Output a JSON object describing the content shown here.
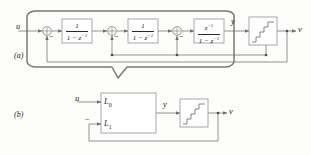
{
  "figure": {
    "part_a_label": "(a)",
    "part_b_label": "(b)",
    "colors": {
      "line": "#6f6f6f",
      "callout_outline": "#7a7a72",
      "text": "#1c1c1c",
      "background": "#fdfdfc"
    }
  },
  "diagram_a": {
    "input_label": "u",
    "output_node_label": "y",
    "final_output_label": "v",
    "summers": [
      {
        "name": "summer-1",
        "sign_label": "−"
      },
      {
        "name": "summer-2",
        "sign_label": "−"
      },
      {
        "name": "summer-3",
        "sign_label": "−"
      }
    ],
    "blocks": [
      {
        "name": "integrator-1",
        "numerator": "1",
        "denominator_pre": "1 − z",
        "denominator_sup": "−1"
      },
      {
        "name": "integrator-2",
        "numerator": "1",
        "denominator_pre": "1 − z",
        "denominator_sup": "−1"
      },
      {
        "name": "integrator-3",
        "numerator_pre": "z",
        "numerator_sup": "−1",
        "denominator_pre": "1 − z",
        "denominator_sup": "−1"
      }
    ],
    "quantizer": {
      "name": "quantizer",
      "icon": "staircase-icon"
    }
  },
  "diagram_b": {
    "input_label": "u",
    "output_node_label": "y",
    "final_output_label": "v",
    "feedback_sign_label": "−",
    "loop_filter": {
      "name": "loop-filter",
      "port_top_label": "L",
      "port_top_sub": "0",
      "port_bottom_label": "L",
      "port_bottom_sub": "1"
    },
    "quantizer": {
      "name": "quantizer",
      "icon": "staircase-icon"
    }
  }
}
